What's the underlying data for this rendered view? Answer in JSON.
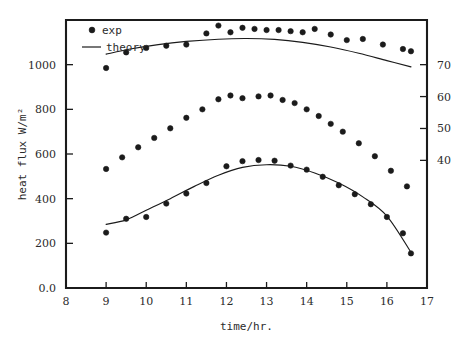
{
  "chart_data": {
    "type": "scatter",
    "title": "",
    "xlabel": "time/hr.",
    "ylabel": "heat flux W/m²",
    "ylabel_right": "",
    "xlim": [
      8,
      17
    ],
    "ylim": [
      0,
      1200
    ],
    "ylim_right": [
      0,
      84
    ],
    "grid": false,
    "legend_position": "top-left",
    "xticks": [
      "8",
      "9",
      "10",
      "11",
      "12",
      "13",
      "14",
      "15",
      "16",
      "17"
    ],
    "xtick_values": [
      8,
      9,
      10,
      11,
      12,
      13,
      14,
      15,
      16,
      17
    ],
    "yticks": [
      "0.0",
      "200",
      "400",
      "600",
      "800",
      "1000"
    ],
    "ytick_values": [
      0,
      200,
      400,
      600,
      800,
      1000
    ],
    "yticks_right": [
      "40",
      "50",
      "60",
      "70"
    ],
    "ytick_right_values": [
      40,
      50,
      60,
      70
    ],
    "legend": [
      {
        "label": "exp",
        "marker": "filled-circle"
      },
      {
        "label": "theory",
        "marker": "line"
      }
    ],
    "series": [
      {
        "name": "upper-exp",
        "kind": "scatter",
        "marker": "filled-circle",
        "x": [
          9.0,
          9.5,
          10.0,
          10.5,
          11.0,
          11.5,
          11.8,
          12.1,
          12.4,
          12.7,
          13.0,
          13.3,
          13.6,
          13.9,
          14.2,
          14.6,
          15.0,
          15.4,
          15.9,
          16.4,
          16.6
        ],
        "y": [
          985,
          1055,
          1075,
          1085,
          1090,
          1140,
          1175,
          1145,
          1165,
          1160,
          1155,
          1155,
          1150,
          1145,
          1160,
          1135,
          1110,
          1115,
          1090,
          1070,
          1060
        ]
      },
      {
        "name": "upper-theory",
        "kind": "line",
        "x": [
          9.0,
          9.6,
          10.3,
          11.0,
          11.8,
          12.5,
          13.2,
          13.9,
          14.6,
          15.3,
          16.0,
          16.6
        ],
        "y": [
          1047,
          1070,
          1090,
          1104,
          1114,
          1117,
          1113,
          1100,
          1079,
          1051,
          1018,
          990
        ]
      },
      {
        "name": "middle-exp",
        "kind": "scatter",
        "marker": "filled-circle",
        "x": [
          9.0,
          9.4,
          9.8,
          10.2,
          10.6,
          11.0,
          11.4,
          11.8,
          12.1,
          12.4,
          12.8,
          13.1,
          13.4,
          13.7,
          14.0,
          14.3,
          14.6,
          14.9,
          15.3,
          15.7,
          16.1,
          16.5
        ],
        "y": [
          533,
          585,
          630,
          672,
          715,
          762,
          800,
          845,
          862,
          850,
          858,
          862,
          842,
          828,
          800,
          770,
          735,
          700,
          648,
          590,
          525,
          455
        ]
      },
      {
        "name": "lower-exp",
        "kind": "scatter",
        "marker": "filled-circle",
        "x": [
          9.0,
          9.5,
          10.0,
          10.5,
          11.0,
          11.5,
          12.0,
          12.4,
          12.8,
          13.2,
          13.6,
          14.0,
          14.4,
          14.8,
          15.2,
          15.6,
          16.0,
          16.4,
          16.6
        ],
        "y": [
          248,
          310,
          318,
          378,
          423,
          470,
          545,
          568,
          573,
          570,
          548,
          530,
          498,
          460,
          420,
          375,
          318,
          245,
          155
        ]
      },
      {
        "name": "lower-theory",
        "kind": "line",
        "x": [
          9.0,
          9.5,
          10.0,
          10.6,
          11.2,
          11.8,
          12.4,
          13.0,
          13.6,
          14.2,
          14.8,
          15.4,
          16.0,
          16.6
        ],
        "y": [
          285,
          305,
          348,
          400,
          455,
          505,
          540,
          552,
          545,
          515,
          470,
          408,
          322,
          160
        ]
      }
    ]
  },
  "colors": {
    "axis": "#1b1b1b",
    "marker": "#1b1b1b",
    "curve": "#1b1b1b",
    "background": "#ffffff"
  }
}
